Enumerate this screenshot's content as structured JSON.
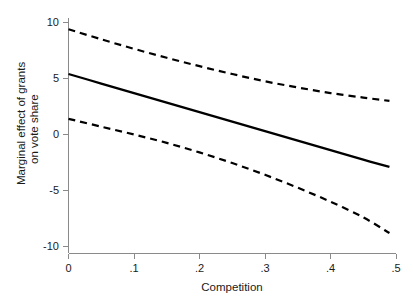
{
  "chart_data": {
    "type": "line",
    "title": "",
    "subtitle": "",
    "xlabel": "Competition",
    "ylabel": "Marginal effect of grants on vote share",
    "ylabel_line1": "Marginal effect of grants",
    "ylabel_line2": "on vote share",
    "xlim": [
      0,
      0.5
    ],
    "ylim": [
      -10,
      10
    ],
    "grid": false,
    "legend": "none",
    "xticks": [
      0,
      0.1,
      0.2,
      0.3,
      0.4,
      0.5
    ],
    "xticklabels": [
      "0",
      ".1",
      ".2",
      ".3",
      ".4",
      ".5"
    ],
    "yticks": [
      -10,
      -5,
      0,
      5,
      10
    ],
    "yticklabels": [
      "-10",
      "-5",
      "0",
      "5",
      "10"
    ],
    "x": [
      0.0,
      0.05,
      0.1,
      0.15,
      0.2,
      0.25,
      0.3,
      0.35,
      0.4,
      0.45,
      0.49
    ],
    "series": [
      {
        "name": "Marginal effect (point estimate)",
        "style": "solid",
        "color": "#000000",
        "values": [
          5.4,
          4.55,
          3.7,
          2.85,
          2.0,
          1.15,
          0.3,
          -0.55,
          -1.4,
          -2.25,
          -2.9
        ]
      },
      {
        "name": "Upper 95% confidence bound",
        "style": "dashed",
        "color": "#000000",
        "values": [
          9.4,
          8.5,
          7.65,
          6.85,
          6.1,
          5.4,
          4.75,
          4.2,
          3.7,
          3.3,
          3.0
        ]
      },
      {
        "name": "Lower 95% confidence bound",
        "style": "dashed",
        "color": "#000000",
        "values": [
          1.4,
          0.7,
          0.0,
          -0.75,
          -1.6,
          -2.55,
          -3.6,
          -4.75,
          -6.0,
          -7.4,
          -8.8
        ]
      }
    ],
    "axis_color": "#8a8a8a",
    "background_color": "#ffffff"
  }
}
